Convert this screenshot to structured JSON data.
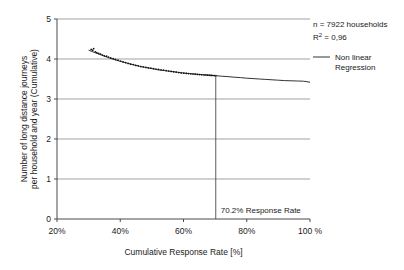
{
  "chart_data": {
    "type": "scatter",
    "title": "",
    "subtitle": "",
    "xlabel": "Cumulative Response Rate [%]",
    "ylabel_line1": "Number of long distance journeys",
    "ylabel_line2": "per household and year (Cumulative)",
    "xlim": [
      20,
      100
    ],
    "ylim": [
      0,
      5
    ],
    "grid": "horizontal",
    "x_ticks": [
      20,
      40,
      60,
      80,
      100
    ],
    "x_tick_labels": [
      "20%",
      "40%",
      "60%",
      "80%",
      "100 %"
    ],
    "y_ticks": [
      0,
      1,
      2,
      3,
      4,
      5
    ],
    "y_tick_labels": [
      "0",
      "1",
      "2",
      "3",
      "4",
      "5"
    ],
    "legend_position": "top-right",
    "series": [
      {
        "name": "Observed data points",
        "type": "scatter",
        "x": [
          30.8,
          31.3,
          31.6,
          32.1,
          32.6,
          33.2,
          33.8,
          34.4,
          35.0,
          35.7,
          36.3,
          37.0,
          37.8,
          38.5,
          39.3,
          40.1,
          40.9,
          41.7,
          42.5,
          43.3,
          44.1,
          44.9,
          45.7,
          46.5,
          47.3,
          48.1,
          48.9,
          49.7,
          50.5,
          51.3,
          52.1,
          52.9,
          53.7,
          54.5,
          55.3,
          56.1,
          56.9,
          57.7,
          58.5,
          59.3,
          60.1,
          60.9,
          61.6,
          62.3,
          63.0,
          63.7,
          64.4,
          65.1,
          65.8,
          66.5,
          67.1,
          67.7,
          68.3,
          68.8,
          69.3,
          69.8,
          70.2
        ],
        "y": [
          4.24,
          4.22,
          4.26,
          4.18,
          4.16,
          4.14,
          4.12,
          4.1,
          4.08,
          4.07,
          4.05,
          4.03,
          4.01,
          3.99,
          3.97,
          3.95,
          3.93,
          3.91,
          3.89,
          3.87,
          3.86,
          3.84,
          3.83,
          3.81,
          3.8,
          3.79,
          3.78,
          3.77,
          3.76,
          3.75,
          3.74,
          3.73,
          3.72,
          3.71,
          3.7,
          3.69,
          3.68,
          3.67,
          3.66,
          3.65,
          3.645,
          3.64,
          3.635,
          3.63,
          3.625,
          3.62,
          3.615,
          3.61,
          3.605,
          3.6,
          3.598,
          3.595,
          3.592,
          3.59,
          3.588,
          3.585,
          3.583
        ]
      },
      {
        "name": "Non linear Regression",
        "type": "line",
        "x": [
          30.0,
          32.0,
          34.0,
          36.0,
          38.0,
          40.0,
          42.0,
          44.0,
          46.0,
          48.0,
          50.0,
          52.0,
          54.0,
          56.0,
          58.0,
          60.0,
          62.0,
          64.0,
          66.0,
          68.0,
          70.0,
          72.0,
          74.0,
          76.0,
          78.0,
          80.0,
          82.0,
          84.0,
          86.0,
          88.0,
          90.0,
          92.0,
          94.0,
          96.0,
          98.0,
          100.0
        ],
        "y": [
          4.22,
          4.16,
          4.1,
          4.04,
          3.99,
          3.94,
          3.9,
          3.86,
          3.82,
          3.79,
          3.76,
          3.73,
          3.71,
          3.69,
          3.67,
          3.65,
          3.635,
          3.62,
          3.61,
          3.6,
          3.585,
          3.57,
          3.56,
          3.545,
          3.535,
          3.52,
          3.51,
          3.5,
          3.49,
          3.48,
          3.47,
          3.46,
          3.455,
          3.45,
          3.445,
          3.42
        ]
      }
    ],
    "marker_line": {
      "name": "response-rate-marker",
      "x": 70.2,
      "label": "70.2% Response Rate",
      "y_from": 0,
      "y_to": 3.6
    },
    "annotations": [
      {
        "name": "sample-size",
        "text": "n = 7922 households"
      },
      {
        "name": "r-squared",
        "text_prefix": "R",
        "text_sup": "2",
        "text_suffix": " = 0,96"
      }
    ],
    "legend": [
      {
        "name": "non-linear-regression",
        "label_line1": "Non linear",
        "label_line2": "Regression",
        "marker": "line-swatch",
        "color": "#333333"
      }
    ],
    "colors": {
      "axis": "#4a4a4a",
      "grid": "#7a7a7a",
      "curve": "#333333",
      "points": "#111111",
      "text": "#1a1a1a",
      "background": "#ffffff"
    }
  }
}
